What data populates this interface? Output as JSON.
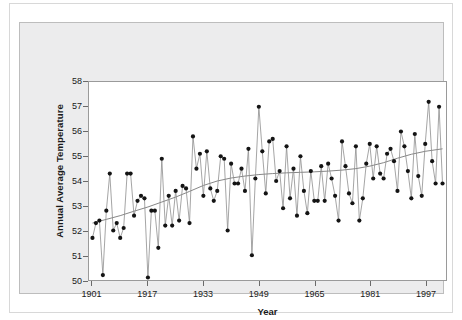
{
  "chart_data": {
    "type": "line",
    "title": "",
    "xlabel": "Year",
    "ylabel": "Annual Average Temperature",
    "xlim": [
      1900,
      2003
    ],
    "ylim": [
      50,
      58
    ],
    "grid": false,
    "legend": "none",
    "x_ticks": [
      "1901",
      "1917",
      "1933",
      "1949",
      "1965",
      "1981",
      "1997"
    ],
    "x_tick_values": [
      1901,
      1917,
      1933,
      1949,
      1965,
      1981,
      1997
    ],
    "y_ticks": [
      "50",
      "51",
      "52",
      "53",
      "54",
      "55",
      "56",
      "57",
      "58"
    ],
    "y_tick_values": [
      50,
      51,
      52,
      53,
      54,
      55,
      56,
      57,
      58
    ],
    "markers": "filled-circle",
    "marker_color": "#141414",
    "line_color": "#8d8d8d",
    "trend_color": "#777777",
    "series": [
      {
        "name": "Annual Average Temperature",
        "x": [
          1901,
          1902,
          1903,
          1904,
          1905,
          1906,
          1907,
          1908,
          1909,
          1910,
          1911,
          1912,
          1913,
          1914,
          1915,
          1916,
          1917,
          1918,
          1919,
          1920,
          1921,
          1922,
          1923,
          1924,
          1925,
          1926,
          1927,
          1928,
          1929,
          1930,
          1931,
          1932,
          1933,
          1934,
          1935,
          1936,
          1937,
          1938,
          1939,
          1940,
          1941,
          1942,
          1943,
          1944,
          1945,
          1946,
          1947,
          1948,
          1949,
          1950,
          1951,
          1952,
          1953,
          1954,
          1955,
          1956,
          1957,
          1958,
          1959,
          1960,
          1961,
          1962,
          1963,
          1964,
          1965,
          1966,
          1967,
          1968,
          1969,
          1970,
          1971,
          1972,
          1973,
          1974,
          1975,
          1976,
          1977,
          1978,
          1979,
          1980,
          1981,
          1982,
          1983,
          1984,
          1985,
          1986,
          1987,
          1988,
          1989,
          1990,
          1991,
          1992,
          1993,
          1994,
          1995,
          1996,
          1997,
          1998,
          1999,
          2000,
          2001,
          2002
        ],
        "values": [
          51.7,
          52.3,
          52.4,
          50.2,
          52.8,
          54.3,
          52.0,
          52.3,
          51.7,
          52.1,
          54.3,
          54.3,
          52.6,
          53.2,
          53.4,
          53.3,
          50.1,
          52.8,
          52.8,
          51.3,
          54.9,
          52.2,
          53.4,
          52.2,
          53.6,
          52.4,
          53.8,
          53.7,
          52.3,
          55.8,
          54.5,
          55.1,
          53.4,
          55.2,
          53.7,
          53.2,
          53.6,
          55.0,
          54.9,
          52.0,
          54.7,
          53.9,
          53.9,
          54.5,
          53.6,
          55.3,
          51.0,
          54.1,
          57.0,
          55.2,
          53.5,
          55.6,
          55.7,
          54.0,
          54.4,
          52.9,
          55.4,
          53.3,
          54.5,
          52.6,
          55.0,
          53.6,
          52.7,
          54.4,
          53.2,
          53.2,
          54.6,
          53.2,
          54.7,
          54.1,
          53.4,
          52.4,
          55.6,
          54.6,
          53.5,
          53.1,
          55.4,
          52.4,
          53.3,
          54.7,
          55.5,
          54.1,
          55.4,
          54.3,
          54.1,
          55.1,
          55.3,
          54.8,
          53.6,
          56.0,
          55.4,
          54.4,
          53.3,
          55.9,
          54.2,
          53.4,
          55.5,
          57.2,
          54.8,
          53.9,
          57.0,
          53.9
        ]
      }
    ],
    "trend": {
      "name": "smoothed trend",
      "x": [
        1901,
        1905,
        1909,
        1913,
        1917,
        1921,
        1925,
        1929,
        1933,
        1937,
        1941,
        1945,
        1949,
        1953,
        1957,
        1961,
        1965,
        1969,
        1973,
        1977,
        1981,
        1985,
        1989,
        1993,
        1997,
        2001,
        2002
      ],
      "values": [
        52.3,
        52.45,
        52.6,
        52.78,
        52.95,
        53.15,
        53.35,
        53.58,
        53.82,
        54.0,
        54.12,
        54.2,
        54.26,
        54.3,
        54.33,
        54.35,
        54.37,
        54.4,
        54.44,
        54.5,
        54.6,
        54.74,
        54.92,
        55.08,
        55.2,
        55.28,
        55.3
      ]
    }
  },
  "axes": {
    "y_title": "Annual Average Temperature",
    "x_title": "Year"
  }
}
